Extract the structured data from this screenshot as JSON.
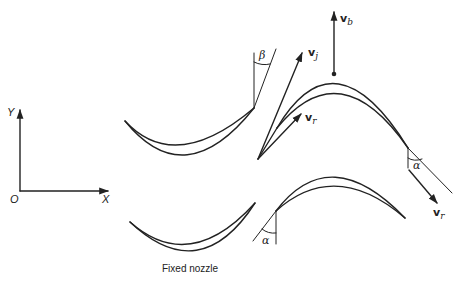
{
  "diagram": {
    "axes": {
      "origin_label": "O",
      "x_label": "X",
      "y_label": "Y"
    },
    "caption": "Fixed nozzle",
    "vectors": {
      "blade_velocity": {
        "symbol": "v",
        "subscript": "b"
      },
      "jet_velocity": {
        "symbol": "v",
        "subscript": "j"
      },
      "relative_velocity_in": {
        "symbol": "v",
        "subscript": "r"
      },
      "relative_velocity_out": {
        "symbol": "v",
        "subscript": "r"
      }
    },
    "angles": {
      "beta": "β",
      "alpha_exit": "α",
      "alpha_nozzle": "α"
    },
    "colors": {
      "stroke": "#222222",
      "background": "#ffffff"
    }
  }
}
